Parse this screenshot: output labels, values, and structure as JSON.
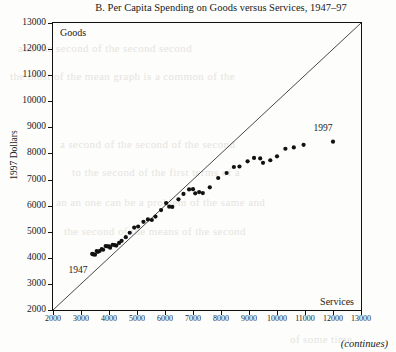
{
  "figure": {
    "title": "B. Per Capita Spending on Goods versus Services, 1947–97",
    "continues_note": "(continues)",
    "bleed_lines": [
      {
        "text": "and the second of the second second",
        "x": 18,
        "y": 42
      },
      {
        "text": "the most of the mean graph is a common of the",
        "x": 10,
        "y": 70
      },
      {
        "text": "a second of the second of the second",
        "x": 60,
        "y": 138
      },
      {
        "text": "to the second of the first terms of a",
        "x": 72,
        "y": 166
      },
      {
        "text": "an an one can be a problem of the same and",
        "x": 56,
        "y": 196
      },
      {
        "text": "the second of the means of the second",
        "x": 64,
        "y": 225
      },
      {
        "text": "of some time",
        "x": 290,
        "y": 333
      }
    ]
  },
  "chart_data": {
    "type": "scatter",
    "title": "B. Per Capita Spending on Goods versus Services, 1947–97",
    "xlabel": "Services",
    "ylabel": "1997 Dollars",
    "goods_axis_label": "Goods",
    "services_axis_label": "Services",
    "xlim": [
      2000,
      13000
    ],
    "ylim": [
      2000,
      13000
    ],
    "xticks": [
      2000,
      3000,
      4000,
      5000,
      6000,
      7000,
      8000,
      9000,
      10000,
      11000,
      12000,
      13000
    ],
    "yticks": [
      2000,
      3000,
      4000,
      5000,
      6000,
      7000,
      8000,
      9000,
      10000,
      11000,
      12000,
      13000
    ],
    "grid": false,
    "legend": "none",
    "reference_line": {
      "name": "45-degree-line",
      "from": [
        2000,
        2000
      ],
      "to": [
        13000,
        13000
      ],
      "note": "equal spending on goods and services"
    },
    "annotations": [
      {
        "text": "1947",
        "x": 3050,
        "y": 3500,
        "points_to": [
          3400,
          4150
        ]
      },
      {
        "text": "1997",
        "x": 11800,
        "y": 8950,
        "points_to": [
          12000,
          8450
        ]
      },
      {
        "text": "Goods",
        "x": 2280,
        "y": 12700
      },
      {
        "text": "Services",
        "x": 12700,
        "y": 2220
      }
    ],
    "series": [
      {
        "name": "Per capita spending, 1947–1997",
        "xlabel_axis": "Services",
        "ylabel_axis": "Goods",
        "marker": "filled-circle",
        "color": "#111111",
        "years": [
          1947,
          1948,
          1949,
          1950,
          1951,
          1952,
          1953,
          1954,
          1955,
          1956,
          1957,
          1958,
          1959,
          1960,
          1961,
          1962,
          1963,
          1964,
          1965,
          1966,
          1967,
          1968,
          1969,
          1970,
          1971,
          1972,
          1973,
          1974,
          1975,
          1976,
          1977,
          1978,
          1979,
          1980,
          1981,
          1982,
          1983,
          1984,
          1985,
          1986,
          1987,
          1988,
          1989,
          1990,
          1991,
          1992,
          1993,
          1994,
          1995,
          1996,
          1997
        ],
        "points": [
          [
            3400,
            4150
          ],
          [
            3440,
            4130
          ],
          [
            3500,
            4120
          ],
          [
            3560,
            4260
          ],
          [
            3600,
            4230
          ],
          [
            3660,
            4260
          ],
          [
            3740,
            4330
          ],
          [
            3790,
            4310
          ],
          [
            3880,
            4450
          ],
          [
            3940,
            4440
          ],
          [
            4000,
            4440
          ],
          [
            4040,
            4390
          ],
          [
            4130,
            4500
          ],
          [
            4200,
            4490
          ],
          [
            4260,
            4470
          ],
          [
            4360,
            4570
          ],
          [
            4450,
            4650
          ],
          [
            4600,
            4790
          ],
          [
            4740,
            4960
          ],
          [
            4900,
            5160
          ],
          [
            5040,
            5200
          ],
          [
            5230,
            5380
          ],
          [
            5390,
            5470
          ],
          [
            5530,
            5450
          ],
          [
            5660,
            5580
          ],
          [
            5860,
            5830
          ],
          [
            6040,
            6100
          ],
          [
            6150,
            5960
          ],
          [
            6260,
            5950
          ],
          [
            6480,
            6240
          ],
          [
            6660,
            6450
          ],
          [
            6860,
            6620
          ],
          [
            7000,
            6630
          ],
          [
            7080,
            6470
          ],
          [
            7220,
            6520
          ],
          [
            7350,
            6480
          ],
          [
            7600,
            6700
          ],
          [
            7900,
            7060
          ],
          [
            8200,
            7250
          ],
          [
            8460,
            7480
          ],
          [
            8660,
            7500
          ],
          [
            8950,
            7700
          ],
          [
            9180,
            7830
          ],
          [
            9400,
            7810
          ],
          [
            9500,
            7640
          ],
          [
            9760,
            7740
          ],
          [
            10000,
            7890
          ],
          [
            10300,
            8180
          ],
          [
            10600,
            8230
          ],
          [
            10950,
            8330
          ],
          [
            12000,
            8450
          ]
        ]
      }
    ]
  }
}
